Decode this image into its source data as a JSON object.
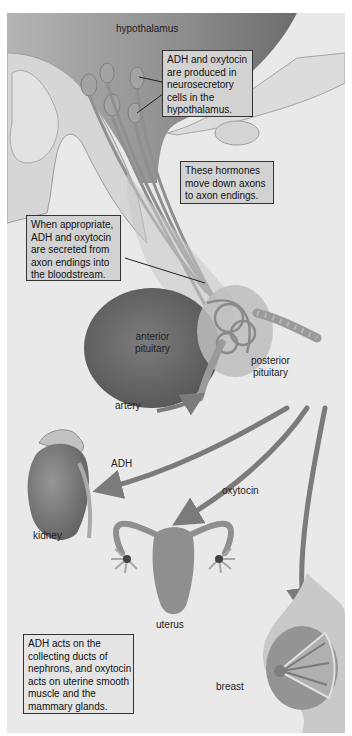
{
  "diagram": {
    "type": "biological-pathway",
    "title": "",
    "labels": {
      "hypothalamus": "hypothalamus",
      "anterior_pituitary": [
        "anterior",
        "pituitary"
      ],
      "posterior_pituitary": [
        "posterior",
        "pituitary"
      ],
      "artery": "artery",
      "adh": "ADH",
      "oxytocin": "oxytocin",
      "kidney": "kidney",
      "uterus": "uterus",
      "breast": "breast"
    },
    "callouts": [
      {
        "id": "production",
        "lines": [
          "ADH and oxytocin",
          "are produced in",
          "neurosecretory",
          "cells in the",
          "hypothalamus."
        ]
      },
      {
        "id": "transport",
        "lines": [
          "These hormones",
          "move down axons",
          "to axon endings."
        ]
      },
      {
        "id": "secretion",
        "lines": [
          "When appropriate,",
          "ADH and oxytocin",
          "are secreted from",
          "axon endings into",
          "the bloodstream."
        ]
      },
      {
        "id": "action",
        "lines": [
          "ADH acts on the",
          "collecting ducts of",
          "nephrons, and oxytocin",
          "acts on uterine smooth",
          "muscle and the",
          "mammary glands."
        ]
      }
    ],
    "flows": [
      {
        "from": "posterior pituitary",
        "to": "kidney",
        "hormone": "ADH"
      },
      {
        "from": "posterior pituitary",
        "to": "uterus",
        "hormone": "oxytocin"
      },
      {
        "from": "posterior pituitary",
        "to": "breast",
        "hormone": "oxytocin"
      },
      {
        "from": "artery",
        "to": "posterior pituitary",
        "hormone": ""
      }
    ],
    "colors": {
      "background": "#e9e9e9",
      "brain_tissue": "#9a9a9a",
      "anterior_pituitary": "#6e6e6e",
      "arrow": "#7d7d7d",
      "callout_fill": "#d2d2d2",
      "organ": "#8a8a8a"
    }
  }
}
